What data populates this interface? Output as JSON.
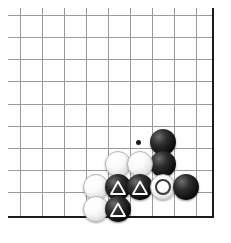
{
  "figure": {
    "kind": "go-board-diagram",
    "board": {
      "background_color": "#ffffff",
      "grid_color": "#9a9a9a",
      "edge_color": "#1b1b1b",
      "grid_spacing_px": 22,
      "corner": "bottom-right",
      "vertical_lines_x": [
        20,
        42,
        64,
        86,
        108,
        130,
        152,
        174,
        196
      ],
      "horizontal_lines_y": [
        15,
        37,
        59,
        81,
        104,
        126,
        148,
        170,
        192
      ],
      "right_edge_x": 212,
      "bottom_edge_y": 216,
      "columns_x": [
        96,
        118,
        140,
        163,
        186
      ],
      "rows_y": [
        142,
        164,
        187,
        209
      ]
    },
    "star_points": [
      {
        "name": "hoshi",
        "x": 138,
        "y": 142
      }
    ],
    "stones": [
      {
        "name": "black-stone",
        "color": "black",
        "x": 163,
        "y": 142,
        "marker": "none"
      },
      {
        "name": "black-stone",
        "color": "black",
        "x": 163,
        "y": 164,
        "marker": "none"
      },
      {
        "name": "white-stone",
        "color": "white",
        "x": 118,
        "y": 164,
        "marker": "none"
      },
      {
        "name": "white-stone",
        "color": "white",
        "x": 140,
        "y": 164,
        "marker": "none"
      },
      {
        "name": "white-stone",
        "color": "white",
        "x": 96,
        "y": 187,
        "marker": "none"
      },
      {
        "name": "black-stone-triangle",
        "color": "black",
        "x": 118,
        "y": 187,
        "marker": "triangle"
      },
      {
        "name": "black-stone-triangle",
        "color": "black",
        "x": 140,
        "y": 187,
        "marker": "triangle"
      },
      {
        "name": "white-stone-circle",
        "color": "white",
        "x": 163,
        "y": 187,
        "marker": "circle"
      },
      {
        "name": "black-stone",
        "color": "black",
        "x": 186,
        "y": 187,
        "marker": "none"
      },
      {
        "name": "white-stone",
        "color": "white",
        "x": 96,
        "y": 209,
        "marker": "none"
      },
      {
        "name": "black-stone-triangle",
        "color": "black",
        "x": 118,
        "y": 209,
        "marker": "triangle"
      }
    ],
    "marker_colors": {
      "triangle_stroke": "#ffffff",
      "circle_stroke": "#3a3a3a"
    }
  }
}
